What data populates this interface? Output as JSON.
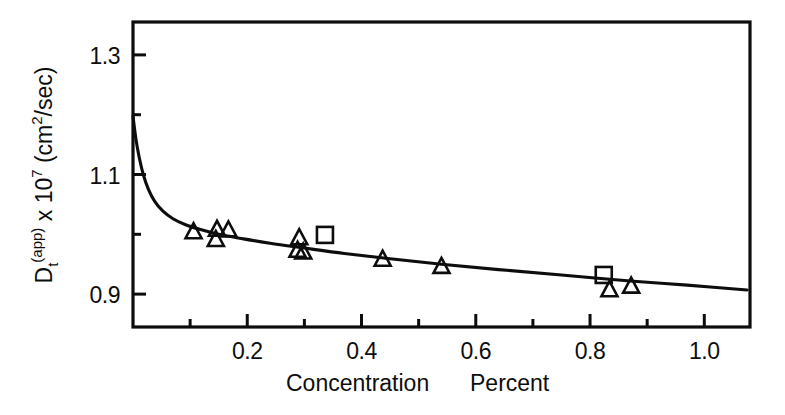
{
  "figure": {
    "background_color": "#ffffff",
    "ink_color": "#0d0d0d"
  },
  "axes": {
    "x_title": "Concentration   Percent",
    "x_title_part1": "Concentration",
    "x_title_part2": "Percent",
    "y_title_plain": "Dt(app) x 107 (cm2/sec)",
    "y_title_base": "D",
    "y_title_sub": "t",
    "y_title_sup_group": "(app)",
    "y_title_mid": " x 10",
    "y_title_exp": "7",
    "y_title_unit_pre": " (cm",
    "y_title_unit_exp": "2",
    "y_title_unit_post": "/sec)"
  },
  "chart_data": {
    "type": "scatter",
    "title": "",
    "xlabel": "Concentration   Percent",
    "ylabel": "Dt(app) x 10^7 (cm^2/sec)",
    "xlim": [
      0.0,
      1.08
    ],
    "ylim": [
      0.845,
      1.355
    ],
    "x_ticks_major": [
      0.2,
      0.4,
      0.6,
      0.8,
      1.0
    ],
    "x_ticks_major_labels": [
      "0.2",
      "0.4",
      "0.6",
      "0.8",
      "1.0"
    ],
    "x_ticks_minor": [
      0.1,
      0.3,
      0.5,
      0.7,
      0.9
    ],
    "y_ticks_major": [
      0.9,
      1.1,
      1.3
    ],
    "y_ticks_major_labels": [
      "0.9",
      "1.1",
      "1.3"
    ],
    "y_ticks_minor": [
      1.0,
      1.2
    ],
    "grid": false,
    "legend": false,
    "frame": true,
    "series": [
      {
        "name": "triangle-series",
        "marker": "triangle",
        "points": [
          {
            "x": 0.106,
            "y": 1.003
          },
          {
            "x": 0.145,
            "y": 0.99
          },
          {
            "x": 0.147,
            "y": 1.007
          },
          {
            "x": 0.167,
            "y": 1.006
          },
          {
            "x": 0.291,
            "y": 0.993
          },
          {
            "x": 0.288,
            "y": 0.972
          },
          {
            "x": 0.298,
            "y": 0.969
          },
          {
            "x": 0.437,
            "y": 0.957
          },
          {
            "x": 0.54,
            "y": 0.945
          },
          {
            "x": 0.834,
            "y": 0.906
          },
          {
            "x": 0.872,
            "y": 0.912
          }
        ]
      },
      {
        "name": "square-series",
        "marker": "square",
        "points": [
          {
            "x": 0.336,
            "y": 0.999
          },
          {
            "x": 0.824,
            "y": 0.932
          }
        ]
      }
    ],
    "fit_curve": {
      "name": "fitted-decay-curve",
      "points": [
        {
          "x": 0.0,
          "y": 1.197
        },
        {
          "x": 0.005,
          "y": 1.16
        },
        {
          "x": 0.011,
          "y": 1.128
        },
        {
          "x": 0.018,
          "y": 1.1
        },
        {
          "x": 0.027,
          "y": 1.075
        },
        {
          "x": 0.038,
          "y": 1.055
        },
        {
          "x": 0.052,
          "y": 1.039
        },
        {
          "x": 0.07,
          "y": 1.026
        },
        {
          "x": 0.092,
          "y": 1.016
        },
        {
          "x": 0.118,
          "y": 1.008
        },
        {
          "x": 0.15,
          "y": 1.0
        },
        {
          "x": 0.19,
          "y": 0.993
        },
        {
          "x": 0.24,
          "y": 0.985
        },
        {
          "x": 0.3,
          "y": 0.977
        },
        {
          "x": 0.37,
          "y": 0.968
        },
        {
          "x": 0.45,
          "y": 0.959
        },
        {
          "x": 0.54,
          "y": 0.95
        },
        {
          "x": 0.64,
          "y": 0.941
        },
        {
          "x": 0.75,
          "y": 0.932
        },
        {
          "x": 0.87,
          "y": 0.922
        },
        {
          "x": 0.97,
          "y": 0.915
        },
        {
          "x": 1.075,
          "y": 0.907
        }
      ]
    }
  }
}
